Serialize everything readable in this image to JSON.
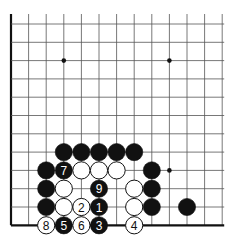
{
  "board": {
    "columns": 13,
    "rows": 12,
    "left_x": 11,
    "top_y": 24,
    "spacing_x": 17.6,
    "spacing_y": 18.3,
    "edges": [
      "left",
      "bottom"
    ],
    "line_color": "#555555",
    "edge_color": "#111111",
    "star_points": [
      [
        3,
        2
      ],
      [
        9,
        2
      ],
      [
        9,
        8
      ]
    ]
  },
  "stones": [
    {
      "col": 3,
      "row": 7,
      "color": "black",
      "label": ""
    },
    {
      "col": 4,
      "row": 7,
      "color": "black",
      "label": ""
    },
    {
      "col": 5,
      "row": 7,
      "color": "black",
      "label": ""
    },
    {
      "col": 6,
      "row": 7,
      "color": "black",
      "label": ""
    },
    {
      "col": 7,
      "row": 7,
      "color": "black",
      "label": ""
    },
    {
      "col": 2,
      "row": 8,
      "color": "black",
      "label": ""
    },
    {
      "col": 3,
      "row": 8,
      "color": "black",
      "label": "7"
    },
    {
      "col": 4,
      "row": 8,
      "color": "white",
      "label": ""
    },
    {
      "col": 5,
      "row": 8,
      "color": "white",
      "label": ""
    },
    {
      "col": 6,
      "row": 8,
      "color": "white",
      "label": ""
    },
    {
      "col": 8,
      "row": 8,
      "color": "black",
      "label": ""
    },
    {
      "col": 2,
      "row": 9,
      "color": "black",
      "label": ""
    },
    {
      "col": 3,
      "row": 9,
      "color": "white",
      "label": ""
    },
    {
      "col": 5,
      "row": 9,
      "color": "black",
      "label": "9"
    },
    {
      "col": 7,
      "row": 9,
      "color": "white",
      "label": ""
    },
    {
      "col": 8,
      "row": 9,
      "color": "black",
      "label": ""
    },
    {
      "col": 2,
      "row": 10,
      "color": "black",
      "label": ""
    },
    {
      "col": 3,
      "row": 10,
      "color": "white",
      "label": ""
    },
    {
      "col": 4,
      "row": 10,
      "color": "white",
      "label": "2"
    },
    {
      "col": 5,
      "row": 10,
      "color": "black",
      "label": "1"
    },
    {
      "col": 7,
      "row": 10,
      "color": "white",
      "label": ""
    },
    {
      "col": 8,
      "row": 10,
      "color": "black",
      "label": ""
    },
    {
      "col": 10,
      "row": 10,
      "color": "black",
      "label": ""
    },
    {
      "col": 2,
      "row": 11,
      "color": "white",
      "label": "8"
    },
    {
      "col": 3,
      "row": 11,
      "color": "black",
      "label": "5"
    },
    {
      "col": 4,
      "row": 11,
      "color": "white",
      "label": "6"
    },
    {
      "col": 5,
      "row": 11,
      "color": "black",
      "label": "3"
    },
    {
      "col": 7,
      "row": 11,
      "color": "white",
      "label": "4"
    }
  ]
}
